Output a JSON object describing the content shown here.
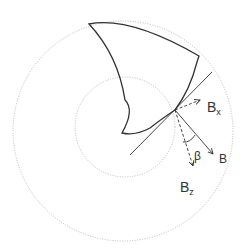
{
  "diagram": {
    "labels": {
      "bx_main": "B",
      "bx_sub": "x",
      "bz_main": "B",
      "bz_sub": "z",
      "b": "B",
      "beta": "β"
    },
    "colors": {
      "stroke": "#333333",
      "circle": "#bbbbbb"
    }
  }
}
